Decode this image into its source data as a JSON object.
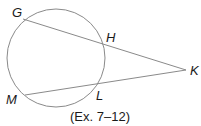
{
  "diagram": {
    "circle": {
      "cx": 56,
      "cy": 58,
      "r": 49,
      "stroke": "#8a8a8a"
    },
    "points": {
      "G": {
        "label": "G",
        "x": 23,
        "y": 19
      },
      "H": {
        "label": "H",
        "x": 102,
        "y": 43
      },
      "K": {
        "label": "K",
        "x": 186,
        "y": 70
      },
      "L": {
        "label": "L",
        "x": 98,
        "y": 82
      },
      "M": {
        "label": "M",
        "x": 25,
        "y": 95
      }
    },
    "segments": [
      {
        "from": "G",
        "to": "K",
        "name": "secant-GK"
      },
      {
        "from": "M",
        "to": "K",
        "name": "secant-MK"
      }
    ],
    "line_color": "#8a8a8a",
    "caption": "(Ex. 7–12)"
  }
}
